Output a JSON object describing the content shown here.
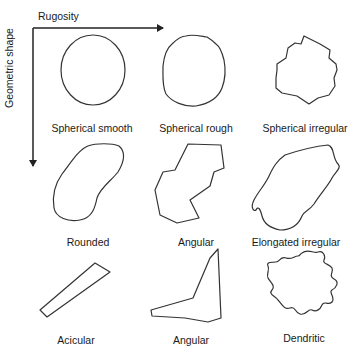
{
  "axes": {
    "x_label": "Rugosity",
    "y_label": "Geometric shape"
  },
  "colors": {
    "stroke": "#333333",
    "background": "#ffffff"
  },
  "shapes": [
    {
      "row": 0,
      "col": 0,
      "label": "Spherical smooth"
    },
    {
      "row": 0,
      "col": 1,
      "label": "Spherical rough"
    },
    {
      "row": 0,
      "col": 2,
      "label": "Spherical irregular"
    },
    {
      "row": 1,
      "col": 0,
      "label": "Rounded"
    },
    {
      "row": 1,
      "col": 1,
      "label": "Angular"
    },
    {
      "row": 1,
      "col": 2,
      "label": "Elongated irregular"
    },
    {
      "row": 2,
      "col": 0,
      "label": "Acicular"
    },
    {
      "row": 2,
      "col": 1,
      "label": "Angular"
    },
    {
      "row": 2,
      "col": 2,
      "label": "Dendritic"
    }
  ]
}
